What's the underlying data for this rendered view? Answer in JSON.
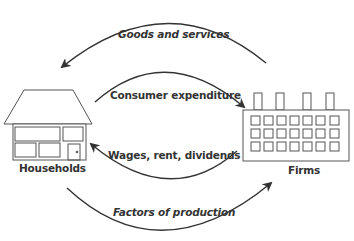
{
  "diagram": {
    "nodes": {
      "households": {
        "label": "Households"
      },
      "firms": {
        "label": "Firms"
      }
    },
    "flows": [
      {
        "id": "goods-and-services",
        "label": "Goods and services",
        "from": "Firms",
        "to": "Households",
        "style": "italic"
      },
      {
        "id": "consumer-expenditure",
        "label": "Consumer expenditure",
        "from": "Households",
        "to": "Firms",
        "style": "bold"
      },
      {
        "id": "wages-rent-dividends",
        "label": "Wages, rent, dividends",
        "from": "Firms",
        "to": "Households",
        "style": "bold"
      },
      {
        "id": "factors-of-production",
        "label": "Factors of production",
        "from": "Households",
        "to": "Firms",
        "style": "italic"
      }
    ],
    "colors": {
      "stroke": "#333333",
      "shape_stroke": "#555555",
      "background": "#ffffff"
    }
  }
}
